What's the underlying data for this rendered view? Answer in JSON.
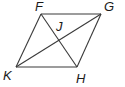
{
  "diagram": {
    "shape": "parallelogram",
    "vertices": {
      "F": {
        "label": "F",
        "x": 41,
        "y": 14,
        "lx": 35,
        "ly": 11
      },
      "G": {
        "label": "G",
        "x": 101,
        "y": 14,
        "lx": 104,
        "ly": 11
      },
      "H": {
        "label": "H",
        "x": 77,
        "y": 67,
        "lx": 76,
        "ly": 83
      },
      "K": {
        "label": "K",
        "x": 16,
        "y": 67,
        "lx": 3,
        "ly": 80
      }
    },
    "intersection": {
      "label": "J",
      "lx": 56,
      "ly": 31
    },
    "stroke_color": "#3a3a3a"
  }
}
